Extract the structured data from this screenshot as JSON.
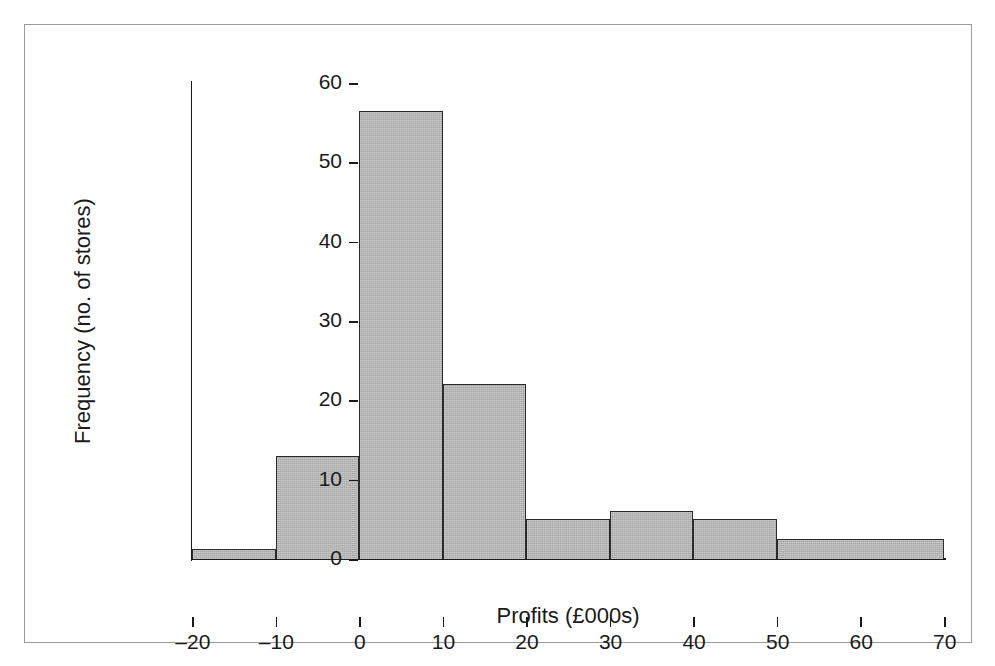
{
  "chart_data": {
    "type": "bar",
    "title": "",
    "subtitle": "",
    "xlabel": "Profits (£000s)",
    "ylabel": "Frequency (no. of stores)",
    "xlim": [
      -20,
      70
    ],
    "ylim": [
      0,
      60
    ],
    "grid": false,
    "legend": null,
    "x_ticks": [
      -20,
      -10,
      0,
      10,
      20,
      30,
      40,
      50,
      60,
      70
    ],
    "x_tick_labels": [
      "–20",
      "–10",
      "0",
      "10",
      "20",
      "30",
      "40",
      "50",
      "60",
      "70"
    ],
    "y_ticks": [
      0,
      10,
      20,
      30,
      40,
      50,
      60
    ],
    "y_tick_labels": [
      "0",
      "10",
      "20",
      "30",
      "40",
      "50",
      "60"
    ],
    "bin_edges": [
      -20,
      -10,
      0,
      10,
      20,
      30,
      40,
      50,
      70
    ],
    "categories": [
      "−20 to −10",
      "−10 to 0",
      "0 to 10",
      "10 to 20",
      "20 to 30",
      "30 to 40",
      "40 to 50",
      "50 to 70"
    ],
    "values": [
      1.2,
      13,
      56.5,
      22,
      5,
      6,
      5,
      2.5
    ],
    "bars": [
      {
        "label": "−20 to −10",
        "x0": -20,
        "x1": -10,
        "value": 1.2
      },
      {
        "label": "−10 to 0",
        "x0": -10,
        "x1": 0,
        "value": 13
      },
      {
        "label": "0 to 10",
        "x0": 0,
        "x1": 10,
        "value": 56.5
      },
      {
        "label": "10 to 20",
        "x0": 10,
        "x1": 20,
        "value": 22
      },
      {
        "label": "20 to 30",
        "x0": 20,
        "x1": 30,
        "value": 5
      },
      {
        "label": "30 to 40",
        "x0": 30,
        "x1": 40,
        "value": 6
      },
      {
        "label": "40 to 50",
        "x0": 40,
        "x1": 50,
        "value": 5
      },
      {
        "label": "50 to 70",
        "x0": 50,
        "x1": 70,
        "value": 2.5
      }
    ],
    "colors": {
      "bar_fill": "#b6b6b6",
      "bar_edge": "#2b2b2b",
      "axis": "#1a1a1a",
      "frame": "#9a9a9a",
      "background": "#ffffff",
      "text": "#1a1a1a"
    }
  }
}
